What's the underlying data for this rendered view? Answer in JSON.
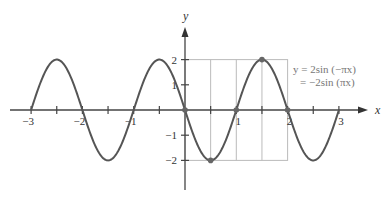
{
  "chart_data": {
    "type": "line",
    "title": "",
    "xlabel": "x",
    "ylabel": "y",
    "xlim": [
      -3.3,
      3.6
    ],
    "ylim": [
      -3.2,
      3.6
    ],
    "grid": false,
    "x_ticks": [
      -3,
      -2.5,
      -2,
      -1.5,
      -1,
      -0.5,
      0.5,
      1,
      1.5,
      2,
      2.5,
      3
    ],
    "x_tick_labels": [
      {
        "value": -3,
        "label": "−3"
      },
      {
        "value": -2,
        "label": "−2"
      },
      {
        "value": -1,
        "label": "−1"
      },
      {
        "value": 1,
        "label": "1"
      },
      {
        "value": 2,
        "label": "2"
      },
      {
        "value": 3,
        "label": "3"
      }
    ],
    "y_tick_labels": [
      {
        "value": 2,
        "label": "2"
      },
      {
        "value": 1,
        "label": "1"
      },
      {
        "value": -1,
        "label": "−1"
      },
      {
        "value": -2,
        "label": "−2"
      }
    ],
    "series": [
      {
        "name": "y = 2sin(−πx)",
        "function": "-2*sin(pi*x)",
        "domain": [
          -3,
          3
        ],
        "color": "#555555",
        "key_points": [
          [
            0,
            0
          ],
          [
            0.5,
            -2
          ],
          [
            1,
            0
          ],
          [
            1.5,
            2
          ],
          [
            2,
            0
          ]
        ]
      }
    ],
    "highlight_box": {
      "x_range": [
        0,
        2
      ],
      "y_range": [
        -2,
        2
      ],
      "vertical_lines": [
        0.5,
        1,
        1.5
      ],
      "color": "#bbbbbb"
    },
    "annotation": {
      "line1": "y = 2sin (−πx)",
      "line2": "= −2sin (πx)",
      "position": "top-right"
    }
  }
}
